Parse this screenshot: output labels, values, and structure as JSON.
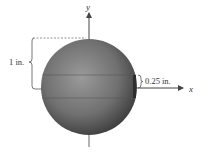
{
  "diagram": {
    "type": "sphere-with-hole",
    "axes": {
      "x_label": "x",
      "y_label": "y"
    },
    "dimensions": {
      "radius_label": "1 in.",
      "hole_label": "0.25 in."
    },
    "colors": {
      "sphere_dark": "#3a3a3a",
      "sphere_mid": "#6e6e6e",
      "sphere_light": "#9a9a9a",
      "axis": "#444444",
      "text": "#333333",
      "background": "#ffffff"
    }
  }
}
